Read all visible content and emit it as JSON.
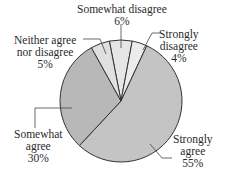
{
  "chart_data": {
    "type": "pie",
    "title": "",
    "start_angle_deg": -11,
    "direction": "clockwise",
    "slices": [
      {
        "label": "Somewhat disagree",
        "value": 6,
        "color": "#e6e6e6"
      },
      {
        "label": "Strongly disagree",
        "value": 4,
        "color": "#ececec"
      },
      {
        "label": "Strongly agree",
        "value": 55,
        "color": "#c4c4c4"
      },
      {
        "label": "Somewhat agree",
        "value": 30,
        "color": "#b8b8b8"
      },
      {
        "label": "Neither agree nor disagree",
        "value": 5,
        "color": "#e0e0e0"
      }
    ],
    "labels": {
      "somewhat_disagree": {
        "line1": "Somewhat disagree",
        "pct": "6%"
      },
      "strongly_disagree": {
        "line1": "Strongly",
        "line2": "disagree",
        "pct": "4%"
      },
      "neither": {
        "line1": "Neither agree",
        "line2": "nor disagree",
        "pct": "5%"
      },
      "somewhat_agree": {
        "line1": "Somewhat",
        "line2": "agree",
        "pct": "30%"
      },
      "strongly_agree": {
        "line1": "Strongly",
        "line2": "agree",
        "pct": "55%"
      }
    },
    "outline_color": "#333333"
  }
}
